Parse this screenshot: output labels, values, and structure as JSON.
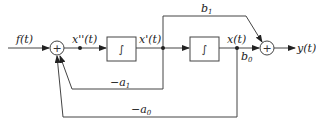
{
  "diagram": {
    "type": "block-diagram",
    "title": "",
    "input": {
      "label": "f(t)"
    },
    "output": {
      "label": "y(t)"
    },
    "nodes": [
      {
        "id": "sum1",
        "kind": "summer",
        "symbol": "+"
      },
      {
        "id": "int1",
        "kind": "integrator",
        "symbol": "∫"
      },
      {
        "id": "int2",
        "kind": "integrator",
        "symbol": "∫"
      },
      {
        "id": "sum2",
        "kind": "summer",
        "symbol": "+"
      }
    ],
    "signals": {
      "x2": "x''(t)",
      "x1": "x'(t)",
      "x0": "x(t)"
    },
    "gains": {
      "b1": {
        "base": "b",
        "sub": "1"
      },
      "b0": {
        "base": "b",
        "sub": "0"
      },
      "a1": {
        "base": "−a",
        "sub": "1"
      },
      "a0": {
        "base": "−a",
        "sub": "0"
      }
    },
    "edges": [
      {
        "from": "f(t)",
        "to": "sum1"
      },
      {
        "from": "sum1",
        "to": "int1",
        "label": "x''(t)"
      },
      {
        "from": "int1",
        "to": "int2",
        "label": "x'(t)"
      },
      {
        "from": "int2",
        "to": "sum2",
        "label": "x(t)",
        "gain": "b0"
      },
      {
        "from": "x'(t)",
        "to": "sum2",
        "gain": "b1"
      },
      {
        "from": "x'(t)",
        "to": "sum1",
        "gain": "-a1"
      },
      {
        "from": "x(t)",
        "to": "sum1",
        "gain": "-a0"
      },
      {
        "from": "sum2",
        "to": "y(t)"
      }
    ]
  }
}
